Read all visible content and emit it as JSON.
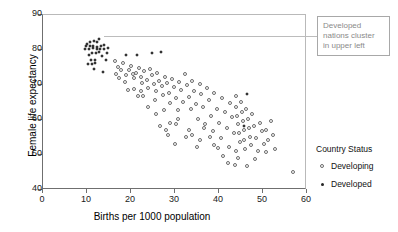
{
  "chart_data": {
    "type": "scatter",
    "title": "",
    "xlabel": "Births per 1000 population",
    "ylabel": "Female life expectancy",
    "xlim": [
      0,
      60
    ],
    "ylim": [
      40,
      90
    ],
    "xticks": [
      0,
      10,
      20,
      30,
      40,
      50,
      60
    ],
    "yticks": [
      40,
      50,
      60,
      70,
      80,
      90
    ],
    "grid": false,
    "legend_position": "right",
    "legend_title": "Country Status",
    "series": [
      {
        "name": "Developed",
        "marker": "filled-circle",
        "color": "#262626",
        "points": [
          [
            10.2,
            81.5
          ],
          [
            11.0,
            82.0
          ],
          [
            11.8,
            82.2
          ],
          [
            12.6,
            81.9
          ],
          [
            10.0,
            80.8
          ],
          [
            10.9,
            80.9
          ],
          [
            11.7,
            81.0
          ],
          [
            12.5,
            80.7
          ],
          [
            13.3,
            80.9
          ],
          [
            14.2,
            81.1
          ],
          [
            9.8,
            80.0
          ],
          [
            10.7,
            80.1
          ],
          [
            11.5,
            80.2
          ],
          [
            12.4,
            80.0
          ],
          [
            13.2,
            79.9
          ],
          [
            14.0,
            80.1
          ],
          [
            15.0,
            80.3
          ],
          [
            12.9,
            83.0
          ],
          [
            11.4,
            79.0
          ],
          [
            12.2,
            78.8
          ],
          [
            13.0,
            79.1
          ],
          [
            14.8,
            79.0
          ],
          [
            10.6,
            78.2
          ],
          [
            13.6,
            78.0
          ],
          [
            11.1,
            77.0
          ],
          [
            12.0,
            76.9
          ],
          [
            10.5,
            75.8
          ],
          [
            11.3,
            75.6
          ],
          [
            12.1,
            75.9
          ],
          [
            11.9,
            74.2
          ],
          [
            13.8,
            73.5
          ],
          [
            19.2,
            78.2
          ],
          [
            21.5,
            78.3
          ],
          [
            25.1,
            79.0
          ],
          [
            27.0,
            79.2
          ],
          [
            46.6,
            67.2
          ],
          [
            45.8,
            58.1
          ],
          [
            14.6,
            76.9
          ]
        ]
      },
      {
        "name": "Developing",
        "marker": "open-circle",
        "color": "#6b6b6b",
        "points": [
          [
            16.5,
            76.5
          ],
          [
            17.2,
            74.9
          ],
          [
            18.0,
            73.9
          ],
          [
            18.4,
            76.0
          ],
          [
            19.0,
            72.6
          ],
          [
            19.8,
            74.0
          ],
          [
            20.2,
            75.1
          ],
          [
            20.6,
            73.0
          ],
          [
            21.0,
            71.6
          ],
          [
            21.4,
            73.2
          ],
          [
            22.0,
            74.6
          ],
          [
            22.4,
            72.1
          ],
          [
            22.8,
            70.4
          ],
          [
            23.2,
            73.7
          ],
          [
            23.8,
            71.2
          ],
          [
            24.2,
            69.0
          ],
          [
            24.6,
            74.3
          ],
          [
            25.0,
            72.5
          ],
          [
            25.4,
            70.1
          ],
          [
            25.8,
            68.0
          ],
          [
            26.2,
            73.1
          ],
          [
            26.6,
            71.0
          ],
          [
            27.2,
            69.5
          ],
          [
            27.6,
            66.8
          ],
          [
            28.0,
            72.0
          ],
          [
            28.4,
            70.2
          ],
          [
            28.8,
            67.4
          ],
          [
            29.2,
            64.5
          ],
          [
            29.6,
            71.3
          ],
          [
            30.0,
            69.1
          ],
          [
            30.4,
            66.0
          ],
          [
            30.8,
            62.5
          ],
          [
            31.2,
            70.5
          ],
          [
            31.6,
            68.3
          ],
          [
            32.0,
            65.0
          ],
          [
            32.4,
            72.8
          ],
          [
            33.0,
            69.8
          ],
          [
            33.4,
            66.4
          ],
          [
            33.8,
            63.0
          ],
          [
            34.2,
            71.0
          ],
          [
            34.6,
            68.0
          ],
          [
            35.0,
            64.2
          ],
          [
            35.4,
            60.0
          ],
          [
            35.8,
            70.0
          ],
          [
            36.2,
            67.1
          ],
          [
            36.6,
            63.5
          ],
          [
            37.0,
            58.5
          ],
          [
            37.4,
            69.0
          ],
          [
            38.0,
            65.5
          ],
          [
            38.4,
            61.0
          ],
          [
            38.8,
            56.5
          ],
          [
            39.2,
            67.5
          ],
          [
            39.8,
            63.0
          ],
          [
            40.2,
            59.0
          ],
          [
            40.6,
            54.5
          ],
          [
            41.0,
            66.0
          ],
          [
            41.6,
            62.0
          ],
          [
            42.0,
            57.5
          ],
          [
            42.4,
            52.0
          ],
          [
            42.8,
            64.5
          ],
          [
            43.2,
            60.5
          ],
          [
            43.6,
            56.0
          ],
          [
            44.0,
            66.5
          ],
          [
            44.2,
            63.5
          ],
          [
            44.4,
            61.0
          ],
          [
            44.6,
            58.5
          ],
          [
            44.8,
            56.0
          ],
          [
            45.0,
            53.5
          ],
          [
            45.2,
            65.0
          ],
          [
            45.4,
            62.0
          ],
          [
            45.6,
            59.5
          ],
          [
            45.8,
            57.0
          ],
          [
            46.0,
            54.0
          ],
          [
            46.2,
            51.5
          ],
          [
            46.4,
            63.0
          ],
          [
            46.8,
            60.0
          ],
          [
            47.0,
            57.5
          ],
          [
            47.2,
            55.0
          ],
          [
            47.4,
            52.5
          ],
          [
            47.8,
            61.5
          ],
          [
            48.2,
            58.0
          ],
          [
            48.6,
            54.5
          ],
          [
            49.0,
            51.0
          ],
          [
            49.6,
            59.0
          ],
          [
            50.0,
            56.5
          ],
          [
            50.4,
            53.0
          ],
          [
            51.0,
            57.0
          ],
          [
            51.4,
            54.0
          ],
          [
            52.0,
            59.5
          ],
          [
            52.6,
            55.5
          ],
          [
            53.0,
            51.5
          ],
          [
            44.5,
            49.0
          ],
          [
            42.2,
            47.5
          ],
          [
            57.0,
            45.0
          ],
          [
            48.5,
            48.5
          ],
          [
            36.0,
            54.0
          ],
          [
            33.5,
            57.0
          ],
          [
            30.5,
            58.5
          ],
          [
            28.2,
            57.0
          ],
          [
            29.0,
            59.0
          ],
          [
            34.0,
            55.5
          ],
          [
            39.0,
            52.5
          ],
          [
            41.2,
            49.5
          ],
          [
            43.8,
            47.0
          ],
          [
            26.0,
            61.5
          ],
          [
            24.0,
            63.5
          ],
          [
            23.0,
            66.5
          ],
          [
            20.8,
            68.5
          ],
          [
            18.8,
            70.5
          ],
          [
            17.5,
            71.8
          ],
          [
            16.8,
            72.8
          ],
          [
            31.0,
            60.0
          ],
          [
            27.8,
            62.5
          ],
          [
            25.6,
            65.5
          ],
          [
            36.8,
            57.5
          ],
          [
            38.2,
            54.8
          ],
          [
            40.0,
            51.8
          ],
          [
            50.8,
            50.5
          ],
          [
            46.5,
            46.5
          ],
          [
            35.2,
            52.0
          ],
          [
            32.8,
            55.0
          ],
          [
            30.2,
            53.0
          ],
          [
            28.6,
            55.5
          ],
          [
            26.8,
            58.0
          ],
          [
            22.6,
            68.0
          ],
          [
            21.8,
            66.5
          ],
          [
            19.6,
            68.2
          ],
          [
            44.0,
            51.0
          ]
        ]
      }
    ],
    "annotations": [
      {
        "text": "Developed nations cluster in upper left",
        "lines": [
          "Developed",
          "nations cluster",
          "in upper left"
        ],
        "target": [
          11.5,
          81.5
        ],
        "color": "#8a8a8a"
      }
    ]
  }
}
